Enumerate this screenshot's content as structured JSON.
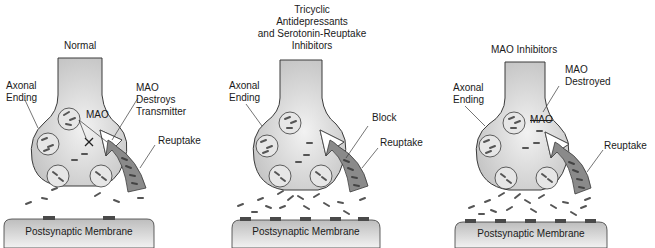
{
  "caption_fragment": "...synaptic cleft...",
  "colors": {
    "neuron_fill": "#cfcfcf",
    "neuron_highlight": "#f0f0f0",
    "outline": "#3a3a3a",
    "neurotransmitter": "#555555",
    "reuptake_arrow": "#8a8a8a",
    "membrane_fill": "#d4d4d4",
    "receptor": "#4a4a4a"
  },
  "panels": [
    {
      "title": "Normal",
      "axonal_ending": "Axonal\nEnding",
      "mao_label": "MAO",
      "annotation": "MAO\nDestroys\nTransmitter",
      "reuptake": "Reuptake",
      "membrane": "Postsynaptic Membrane"
    },
    {
      "title": "Tricyclic\nAntidepressants\nand Serotonin-Reuptake\nInhibitors",
      "axonal_ending": "Axonal\nEnding",
      "annotation": "Block",
      "reuptake": "Reuptake",
      "membrane": "Postsynaptic Membrane"
    },
    {
      "title": "MAO Inhibitors",
      "axonal_ending": "Axonal\nEnding",
      "mao_label": "MAO",
      "annotation": "MAO\nDestroyed",
      "reuptake": "Reuptake",
      "membrane": "Postsynaptic Membrane"
    }
  ]
}
